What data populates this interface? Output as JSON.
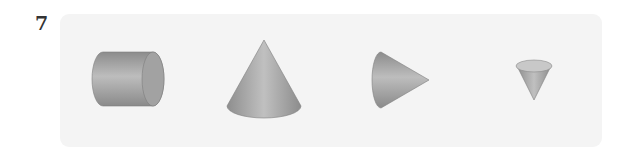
{
  "problem": {
    "number": "7",
    "shapes": [
      {
        "name": "cylinder",
        "orientation": "lying horizontally"
      },
      {
        "name": "cone",
        "orientation": "upright"
      },
      {
        "name": "cone",
        "orientation": "lying on side, apex pointing right"
      },
      {
        "name": "cone",
        "orientation": "inverted, apex pointing down"
      }
    ]
  },
  "colors": {
    "panel_bg": "#f4f4f4",
    "shape_dark": "#8a8a8a",
    "shape_light": "#b8b8b8",
    "number_text": "#333333"
  }
}
